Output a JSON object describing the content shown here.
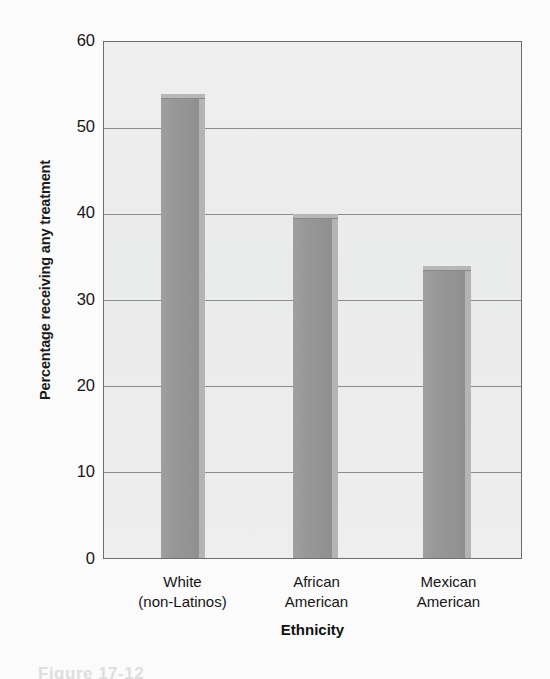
{
  "figure": {
    "caption_partial": "Figure  17-12"
  },
  "chart_data": {
    "type": "bar",
    "title": "",
    "subtitle": "",
    "categories": [
      "White (non-Latinos)",
      "African American",
      "Mexican American"
    ],
    "category_lines": [
      [
        "White",
        "(non-Latinos)"
      ],
      [
        "African",
        "American"
      ],
      [
        "Mexican",
        "American"
      ]
    ],
    "values": [
      54,
      40,
      34
    ],
    "xlabel": "Ethnicity",
    "ylabel": "Percentage receiving any treatment",
    "ylim": [
      0,
      60
    ],
    "ytick_step": 10,
    "yticks": [
      0,
      10,
      20,
      30,
      40,
      50,
      60
    ],
    "ytick_labels": [
      "0",
      "10",
      "20",
      "30",
      "40",
      "50",
      "60"
    ],
    "gridlines": [
      10,
      20,
      30,
      40,
      50
    ],
    "grid": true,
    "legend": null,
    "legend_position": "none",
    "bar_style": "3d-extruded",
    "colors": {
      "bar_face": "#9a9a9a",
      "bar_top": "#b9b9b9",
      "bar_side": "#b6b6b6",
      "plot_background": "#eff0f0",
      "gridline": "#7b7b7b",
      "frame": "#6f6f6f",
      "text": "#161616",
      "page_background": "#fdfdfd"
    }
  }
}
